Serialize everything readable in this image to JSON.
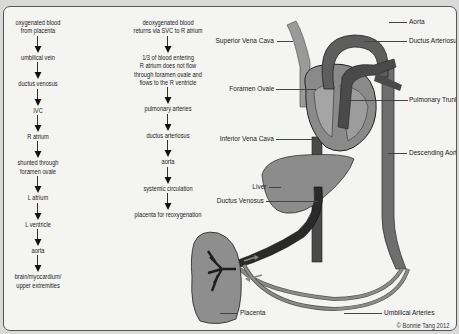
{
  "flow_left": {
    "steps": [
      "oxygenated blood\nfrom placenta",
      "umbilical vein",
      "ductus venosus",
      "IVC",
      "R atrium",
      "shunted through\nforamen ovale",
      "L atrium",
      "L ventricle",
      "aorta",
      "brain/myocardium/\nupper extremities"
    ]
  },
  "flow_middle": {
    "steps": [
      "deoxygenated blood\nreturns via SVC to R atrium",
      "1/3 of blood entering\nR atrium does not flow\nthrough foramen ovale and\nflows to the R ventricle",
      "pulmonary arteries",
      "ductus arteriosus",
      "aorta",
      "systemic circulation",
      "placenta for reoxygenation"
    ]
  },
  "labels": {
    "aorta": "Aorta",
    "ductus_arteriosus": "Ductus Arteriosus",
    "superior_vena_cava": "Superior Vena Cava",
    "foramen_ovale": "Foramen Ovale",
    "pulmonary_trunk": "Pulmonary Trunk",
    "inferior_vena_cava": "Inferior Vena Cava",
    "descending_aorta": "Descending Aorta",
    "liver": "Liver",
    "ductus_venosus": "Ductus Venosus",
    "placenta": "Placenta",
    "umbilical_arteries": "Umbilical Arteries"
  },
  "copyright": "© Bonnie Tang 2012",
  "colors": {
    "vessel_dark": "#4a4a4a",
    "vessel_mid": "#7a7a7a",
    "organ_fill": "#8c8c8c",
    "panel_bg": "#f4f4f2"
  }
}
